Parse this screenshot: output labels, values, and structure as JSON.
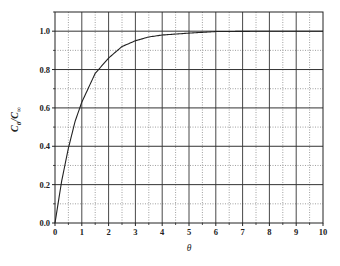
{
  "chart_data": {
    "type": "line",
    "title": "",
    "xlabel": "θ",
    "ylabel": "C_θ/C_∞",
    "ylabel_parts": {
      "main": "C",
      "sub1": "θ",
      "slash": "/C",
      "sub2": "∞"
    },
    "xlim": [
      0,
      10
    ],
    "ylim": [
      0,
      1.1
    ],
    "x_ticks": [
      0,
      1,
      2,
      3,
      4,
      5,
      6,
      7,
      8,
      9,
      10
    ],
    "x_tick_labels": [
      "0",
      "1",
      "2",
      "3",
      "4",
      "5",
      "6",
      "7",
      "8",
      "9",
      "10"
    ],
    "y_ticks": [
      0.0,
      0.2,
      0.4,
      0.6,
      0.8,
      1.0
    ],
    "y_tick_labels": [
      "0.0",
      "0.2",
      "0.4",
      "0.6",
      "0.8",
      "1.0"
    ],
    "grid": {
      "major": "solid",
      "minor": "dotted",
      "x_minor_step": 0.5,
      "y_minor_step": 0.1
    },
    "legend": null,
    "series": [
      {
        "name": "C_θ/C_∞",
        "x": [
          0,
          0.25,
          0.5,
          0.75,
          1,
          1.5,
          2,
          2.5,
          3,
          3.5,
          4,
          5,
          6,
          7,
          8,
          9,
          10
        ],
        "values": [
          0.0,
          0.22,
          0.39,
          0.53,
          0.63,
          0.78,
          0.86,
          0.92,
          0.95,
          0.97,
          0.98,
          0.99,
          0.998,
          0.999,
          1.0,
          1.0,
          1.0
        ]
      }
    ]
  },
  "colors": {
    "line": "#222222",
    "grid_major": "#333333",
    "grid_minor": "#888888",
    "background": "#ffffff"
  }
}
